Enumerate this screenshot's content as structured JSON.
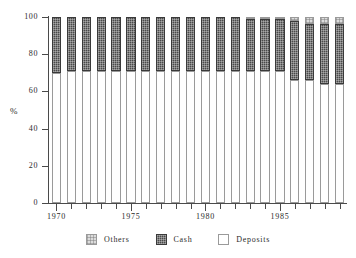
{
  "chart_data": {
    "type": "bar",
    "subtype": "stacked-percentage",
    "title": "",
    "subtitle": "",
    "xlabel": "",
    "ylabel": "%",
    "ylim": [
      0,
      100
    ],
    "yticks": [
      0,
      20,
      40,
      60,
      80,
      100
    ],
    "ytick_labels": [
      "0",
      "20",
      "40",
      "60",
      "80",
      "100"
    ],
    "xlim": [
      1969.5,
      1989.5
    ],
    "xticks": [
      1970,
      1975,
      1980,
      1985
    ],
    "xtick_labels": [
      "1970",
      "1975",
      "1980",
      "1985"
    ],
    "grid": false,
    "legend_position": "bottom",
    "stack_order": [
      "Deposits",
      "Cash",
      "Others"
    ],
    "categories": [
      "1970",
      "1971",
      "1972",
      "1973",
      "1974",
      "1975",
      "1976",
      "1977",
      "1978",
      "1979",
      "1980",
      "1981",
      "1982",
      "1983",
      "1984",
      "1985",
      "1986",
      "1987",
      "1988",
      "1989"
    ],
    "series": [
      {
        "name": "Deposits",
        "color": "#ffffff",
        "values": [
          70,
          71,
          71,
          71,
          71,
          71,
          71,
          71,
          71,
          71,
          71,
          71,
          71,
          71,
          71,
          71,
          66,
          66,
          64,
          64
        ]
      },
      {
        "name": "Cash",
        "color": "#4a4a4a",
        "values": [
          30,
          29,
          29,
          29,
          29,
          29,
          29,
          29,
          29,
          29,
          29,
          29,
          29,
          28,
          28,
          28,
          32,
          30,
          32,
          32
        ]
      },
      {
        "name": "Others",
        "color": "#dcdcdc",
        "values": [
          0,
          0,
          0,
          0,
          0,
          0,
          0,
          0,
          0,
          0,
          0,
          0,
          0,
          1,
          1,
          1,
          2,
          4,
          4,
          4
        ]
      }
    ]
  },
  "axes": {
    "y_axis_title": "%",
    "y_tick_labels": [
      "100",
      "80",
      "60",
      "40",
      "20",
      "0"
    ],
    "x_tick_labels": [
      "1970",
      "1975",
      "1980",
      "1985"
    ]
  },
  "legend": {
    "items": [
      {
        "label": "Others",
        "color": "#dcdcdc",
        "swatch": "others-swatch"
      },
      {
        "label": "Cash",
        "color": "#4a4a4a",
        "swatch": "cash-swatch"
      },
      {
        "label": "Deposits",
        "color": "#ffffff",
        "swatch": "deposits-swatch"
      }
    ]
  }
}
